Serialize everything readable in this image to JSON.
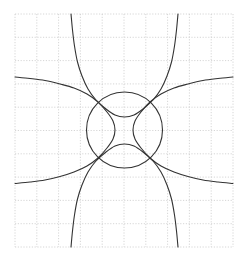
{
  "figure": {
    "title": "",
    "background_color": "#ffffff",
    "width": 248,
    "height": 262
  },
  "chart_data": {
    "type": "line",
    "title": "",
    "subtitle": "",
    "xlabel": "",
    "ylabel": "",
    "xlim": [
      -5,
      5
    ],
    "ylim": [
      -5,
      5
    ],
    "grid": true,
    "grid_style": "dotted",
    "grid_color": "#cccccc",
    "legend": false,
    "legend_position": "none",
    "tick_labels_visible": false,
    "xticks": [
      -5,
      -4,
      -3,
      -2,
      -1,
      0,
      1,
      2,
      3,
      4,
      5
    ],
    "yticks": [
      -5,
      -4,
      -3,
      -2,
      -1,
      0,
      1,
      2,
      3,
      4,
      5
    ],
    "axes_pixel_box": {
      "left": 15,
      "top": 14,
      "right": 233,
      "bottom": 247,
      "cell_width": 21.8,
      "cell_height": 23.3
    },
    "line_color": "#333333",
    "line_width": 1.1,
    "series": [
      {
        "name": "circle",
        "kind": "circle",
        "equation": "x^2 + y^2 = 4",
        "center": [
          0,
          0
        ],
        "radius": 2,
        "center_px": [
          124.5,
          130.0
        ],
        "radius_px": 38.0,
        "color": "#333333"
      },
      {
        "name": "hyperbola-upper",
        "kind": "curve",
        "equation": "y = 2 + 1/(x) family, opens upward",
        "color": "#333333",
        "points_px": [
          [
            71,
            14
          ],
          [
            72.5,
            30
          ],
          [
            74.5,
            46
          ],
          [
            77.5,
            62
          ],
          [
            82,
            76
          ],
          [
            88,
            89
          ],
          [
            96,
            100
          ],
          [
            106,
            109
          ],
          [
            115,
            115
          ],
          [
            124.5,
            117
          ],
          [
            134,
            115
          ],
          [
            143,
            109
          ],
          [
            153,
            100
          ],
          [
            161,
            89
          ],
          [
            167,
            76
          ],
          [
            171.5,
            62
          ],
          [
            174.5,
            46
          ],
          [
            176.5,
            30
          ],
          [
            178,
            14
          ]
        ]
      },
      {
        "name": "hyperbola-lower",
        "kind": "curve",
        "equation": "y = -2 - 1/(x) family, opens downward",
        "color": "#333333",
        "points_px": [
          [
            71,
            247
          ],
          [
            72.5,
            231
          ],
          [
            74.5,
            215
          ],
          [
            77.5,
            199
          ],
          [
            82,
            185
          ],
          [
            88,
            172
          ],
          [
            96,
            161
          ],
          [
            106,
            152
          ],
          [
            115,
            146
          ],
          [
            124.5,
            144
          ],
          [
            134,
            146
          ],
          [
            143,
            152
          ],
          [
            153,
            161
          ],
          [
            161,
            172
          ],
          [
            167,
            185
          ],
          [
            171.5,
            199
          ],
          [
            174.5,
            215
          ],
          [
            176.5,
            231
          ],
          [
            178,
            247
          ]
        ]
      },
      {
        "name": "hyperbola-left",
        "kind": "curve",
        "equation": "x = -2 - 1/(y) family, opens left",
        "color": "#333333",
        "points_px": [
          [
            15,
            77
          ],
          [
            30,
            78.5
          ],
          [
            45,
            80.5
          ],
          [
            60,
            84
          ],
          [
            74,
            88
          ],
          [
            87,
            94
          ],
          [
            98,
            102
          ],
          [
            107,
            112
          ],
          [
            113,
            121
          ],
          [
            115,
            130
          ],
          [
            113,
            139
          ],
          [
            107,
            148
          ],
          [
            98,
            158
          ],
          [
            87,
            166
          ],
          [
            74,
            172
          ],
          [
            60,
            176.5
          ],
          [
            45,
            180
          ],
          [
            30,
            182
          ],
          [
            15,
            183.5
          ]
        ]
      },
      {
        "name": "hyperbola-right",
        "kind": "curve",
        "equation": "x = 2 + 1/(y) family, opens right",
        "color": "#333333",
        "points_px": [
          [
            233,
            77
          ],
          [
            218,
            78.5
          ],
          [
            203,
            80.5
          ],
          [
            188,
            84
          ],
          [
            174,
            88
          ],
          [
            161,
            94
          ],
          [
            150,
            102
          ],
          [
            141,
            112
          ],
          [
            135,
            121
          ],
          [
            133,
            130
          ],
          [
            135,
            139
          ],
          [
            141,
            148
          ],
          [
            150,
            158
          ],
          [
            161,
            166
          ],
          [
            174,
            172
          ],
          [
            188,
            176.5
          ],
          [
            203,
            180
          ],
          [
            218,
            182
          ],
          [
            233,
            183.5
          ]
        ]
      }
    ],
    "annotations": []
  }
}
